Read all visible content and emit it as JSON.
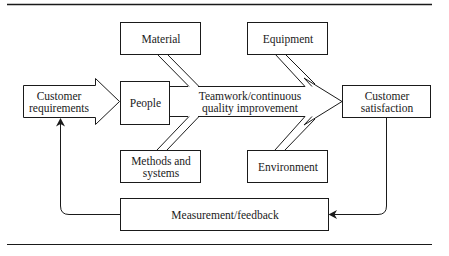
{
  "diagram": {
    "nodes": {
      "customer_requirements": "Customer\nrequirements",
      "people": "People",
      "material": "Material",
      "equipment": "Equipment",
      "methods_systems": "Methods and\nsystems",
      "environment": "Environment",
      "teamwork": "Teamwork/continuous\nquality improvement",
      "customer_satisfaction": "Customer\nsatisfaction",
      "measurement_feedback": "Measurement/feedback"
    },
    "edges": [
      {
        "from": "customer_requirements",
        "to": "people",
        "type": "block-arrow"
      },
      {
        "from": "material",
        "to": "teamwork",
        "type": "diagonal-feeder"
      },
      {
        "from": "methods_systems",
        "to": "teamwork",
        "type": "diagonal-feeder"
      },
      {
        "from": "equipment",
        "to": "teamwork",
        "type": "diagonal-feeder"
      },
      {
        "from": "environment",
        "to": "teamwork",
        "type": "diagonal-feeder"
      },
      {
        "from": "teamwork",
        "to": "customer_satisfaction",
        "type": "block-arrow"
      },
      {
        "from": "customer_satisfaction",
        "to": "measurement_feedback",
        "type": "line-arrow"
      },
      {
        "from": "measurement_feedback",
        "to": "customer_requirements",
        "type": "line-arrow"
      }
    ],
    "colors": {
      "stroke": "#1a1a1a",
      "fill": "#ffffff"
    }
  }
}
